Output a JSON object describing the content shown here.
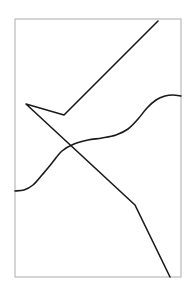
{
  "figure": {
    "title": "",
    "background_color": "#ffffff",
    "width": 196,
    "height": 287,
    "frame": {
      "name": "plot-frame",
      "x": 15,
      "y": 19,
      "width": 166,
      "height": 258,
      "stroke_color": "#b3b3b3",
      "stroke_width": 1.1,
      "fill": "none"
    },
    "curves": [
      {
        "name": "polyline-path",
        "type": "polyline",
        "stroke_color": "#1a1a1a",
        "stroke_width": 1.6,
        "points": [
          [
            158,
            21
          ],
          [
            64,
            115
          ],
          [
            26,
            104
          ],
          [
            135,
            205
          ],
          [
            170,
            277
          ]
        ]
      },
      {
        "name": "s-curve-path",
        "type": "smooth-curve",
        "stroke_color": "#1a1a1a",
        "stroke_width": 1.6,
        "points": [
          [
            15,
            191
          ],
          [
            24,
            190
          ],
          [
            33,
            185
          ],
          [
            42,
            175
          ],
          [
            52,
            163
          ],
          [
            62,
            151
          ],
          [
            74,
            144
          ],
          [
            88,
            140
          ],
          [
            102,
            138
          ],
          [
            116,
            135
          ],
          [
            128,
            129
          ],
          [
            138,
            119
          ],
          [
            147,
            108
          ],
          [
            156,
            100
          ],
          [
            165,
            96
          ],
          [
            173,
            95
          ],
          [
            181,
            96
          ]
        ]
      }
    ]
  }
}
